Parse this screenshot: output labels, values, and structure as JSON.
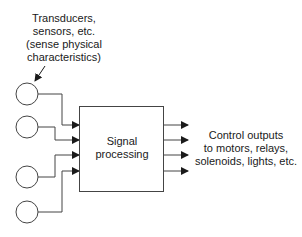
{
  "diagram": {
    "sensor_label": {
      "lines": [
        "Transducers,",
        "sensors, etc.",
        "(sense physical",
        "characteristics)"
      ]
    },
    "processor": {
      "lines": [
        "Signal",
        "processing"
      ]
    },
    "output_label": {
      "lines": [
        "Control outputs",
        "to motors, relays,",
        "solenoids, lights, etc."
      ]
    },
    "inputs_count": 4,
    "outputs_count": 4,
    "stroke_color": "#333333"
  }
}
